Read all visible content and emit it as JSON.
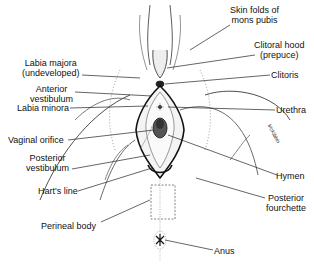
{
  "diagram": {
    "type": "anatomical-illustration",
    "style": "black-and-white line drawing",
    "labels_left": [
      {
        "id": "labia-majora",
        "line1": "Labia majora",
        "line2": "(undeveloped)"
      },
      {
        "id": "anterior-vestibulum",
        "line1": "Anterior",
        "line2": "vestibulum"
      },
      {
        "id": "labia-minora",
        "line1": "Labia minora"
      },
      {
        "id": "vaginal-orifice",
        "line1": "Vaginal orifice"
      },
      {
        "id": "posterior-vestibulum",
        "line1": "Posterior",
        "line2": "vestibulum"
      },
      {
        "id": "harts-line",
        "line1": "Hart's line"
      },
      {
        "id": "perineal-body",
        "line1": "Perineal body"
      }
    ],
    "labels_right": [
      {
        "id": "skin-folds",
        "line1": "Skin folds of",
        "line2": "mons pubis"
      },
      {
        "id": "clitoral-hood",
        "line1": "Clitoral hood",
        "line2": "(prepuce)"
      },
      {
        "id": "clitoris",
        "line1": "Clitoris"
      },
      {
        "id": "urethra",
        "line1": "Urethra"
      },
      {
        "id": "hymen",
        "line1": "Hymen"
      },
      {
        "id": "posterior-fourchette",
        "line1": "Posterior",
        "line2": "fourchette"
      },
      {
        "id": "anus",
        "line1": "Anus"
      }
    ],
    "signature": "McKibbin"
  }
}
